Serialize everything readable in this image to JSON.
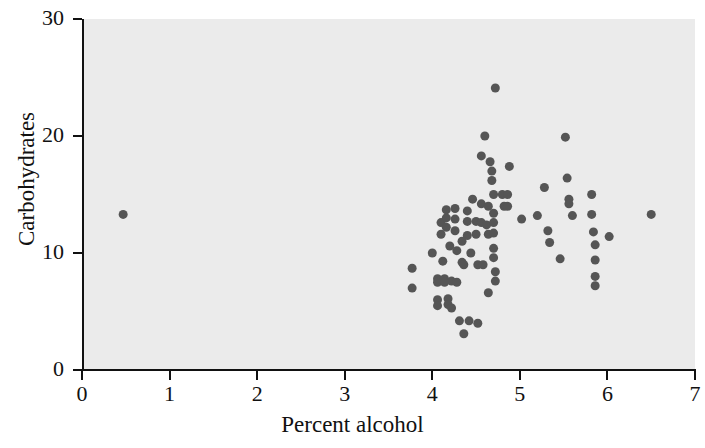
{
  "chart_data": {
    "type": "scatter",
    "title": "",
    "xlabel": "Percent alcohol",
    "ylabel": "Carbohydrates",
    "xlim": [
      0,
      7
    ],
    "ylim": [
      0,
      30
    ],
    "xticks": [
      0,
      1,
      2,
      3,
      4,
      5,
      6,
      7
    ],
    "yticks": [
      0,
      10,
      20,
      30
    ],
    "xtick_labels": [
      "0",
      "1",
      "2",
      "3",
      "4",
      "5",
      "6",
      "7"
    ],
    "ytick_labels": [
      "0",
      "10",
      "20",
      "30"
    ],
    "grid": false,
    "legend": null,
    "marker": {
      "shape": "circle",
      "color": "#555555",
      "size_px": 9
    },
    "plot_background": "#ebebeb",
    "figure_background": "#ffffff",
    "axis_color": "#111111",
    "n_points": 86,
    "points": [
      [
        0.47,
        13.3
      ],
      [
        3.77,
        8.7
      ],
      [
        3.77,
        7.0
      ],
      [
        4.06,
        7.8
      ],
      [
        4.06,
        7.5
      ],
      [
        4.06,
        6.0
      ],
      [
        4.06,
        5.5
      ],
      [
        4.1,
        12.6
      ],
      [
        4.1,
        11.6
      ],
      [
        4.14,
        7.8
      ],
      [
        4.14,
        7.5
      ],
      [
        4.16,
        13.7
      ],
      [
        4.16,
        13.0
      ],
      [
        4.16,
        12.2
      ],
      [
        4.18,
        6.1
      ],
      [
        4.18,
        5.6
      ],
      [
        4.22,
        7.6
      ],
      [
        4.22,
        5.3
      ],
      [
        4.26,
        13.8
      ],
      [
        4.26,
        12.9
      ],
      [
        4.26,
        11.9
      ],
      [
        4.28,
        7.5
      ],
      [
        4.31,
        4.2
      ],
      [
        4.36,
        3.1
      ],
      [
        4.4,
        13.6
      ],
      [
        4.4,
        12.7
      ],
      [
        4.4,
        11.5
      ],
      [
        4.42,
        4.2
      ],
      [
        4.46,
        14.6
      ],
      [
        4.5,
        12.7
      ],
      [
        4.5,
        11.6
      ],
      [
        4.52,
        4.0
      ],
      [
        4.56,
        18.3
      ],
      [
        4.56,
        14.2
      ],
      [
        4.56,
        12.6
      ],
      [
        4.6,
        20.0
      ],
      [
        4.62,
        12.4
      ],
      [
        4.64,
        14.0
      ],
      [
        4.64,
        11.6
      ],
      [
        4.66,
        17.8
      ],
      [
        4.68,
        17.0
      ],
      [
        4.68,
        16.2
      ],
      [
        4.7,
        15.0
      ],
      [
        4.7,
        13.4
      ],
      [
        4.7,
        12.6
      ],
      [
        4.7,
        11.7
      ],
      [
        4.7,
        10.4
      ],
      [
        4.7,
        9.6
      ],
      [
        4.72,
        24.1
      ],
      [
        4.72,
        8.4
      ],
      [
        4.72,
        7.6
      ],
      [
        4.8,
        15.0
      ],
      [
        4.82,
        14.0
      ],
      [
        4.86,
        15.0
      ],
      [
        4.86,
        14.0
      ],
      [
        4.88,
        17.4
      ],
      [
        5.02,
        12.9
      ],
      [
        5.2,
        13.2
      ],
      [
        5.28,
        15.6
      ],
      [
        5.32,
        11.9
      ],
      [
        5.34,
        10.9
      ],
      [
        5.46,
        9.5
      ],
      [
        5.52,
        19.9
      ],
      [
        5.54,
        16.4
      ],
      [
        5.56,
        14.6
      ],
      [
        5.56,
        14.2
      ],
      [
        5.6,
        13.2
      ],
      [
        5.82,
        15.0
      ],
      [
        5.82,
        13.3
      ],
      [
        5.84,
        11.8
      ],
      [
        5.86,
        10.7
      ],
      [
        5.86,
        9.4
      ],
      [
        5.86,
        8.0
      ],
      [
        5.86,
        7.2
      ],
      [
        6.02,
        11.4
      ],
      [
        6.5,
        13.3
      ],
      [
        4.34,
        9.2
      ],
      [
        4.36,
        9.0
      ],
      [
        4.52,
        9.0
      ],
      [
        4.58,
        9.0
      ],
      [
        4.12,
        9.3
      ],
      [
        4.0,
        10.0
      ],
      [
        4.44,
        10.0
      ],
      [
        4.28,
        10.2
      ],
      [
        4.2,
        10.6
      ],
      [
        4.34,
        11.0
      ],
      [
        4.64,
        6.6
      ]
    ]
  }
}
